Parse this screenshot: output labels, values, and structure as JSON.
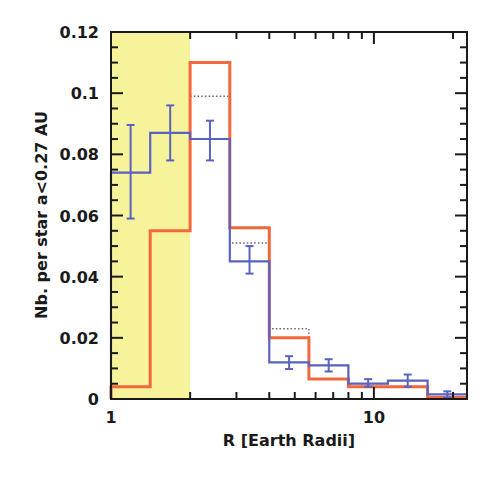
{
  "chart_data": {
    "type": "bar",
    "subtype": "step-histogram",
    "title": "",
    "xlabel": "R [Earth Radii]",
    "ylabel": "Nb. per star a<0.27 AU",
    "xscale": "log",
    "xlim": [
      1,
      22.6
    ],
    "ylim": [
      0,
      0.12
    ],
    "grid": false,
    "legend": null,
    "x_tick_labels": [
      {
        "value": 1,
        "label": "1"
      },
      {
        "value": 10,
        "label": "10"
      }
    ],
    "x_minor_ticks": [
      2,
      3,
      4,
      5,
      6,
      7,
      8,
      9,
      20
    ],
    "y_tick_labels": [
      {
        "value": 0,
        "label": "0"
      },
      {
        "value": 0.02,
        "label": "0.02"
      },
      {
        "value": 0.04,
        "label": "0.04"
      },
      {
        "value": 0.06,
        "label": "0.06"
      },
      {
        "value": 0.08,
        "label": "0.08"
      },
      {
        "value": 0.1,
        "label": "0.1"
      },
      {
        "value": 0.12,
        "label": "0.12"
      }
    ],
    "bin_edges": [
      1,
      1.41,
      2,
      2.83,
      4,
      5.66,
      8,
      11.3,
      16,
      22.6
    ],
    "shaded_region": {
      "x_from": 1,
      "x_to": 2,
      "color": "#f7f39a"
    },
    "series": [
      {
        "name": "orange-histogram",
        "color": "#f2683c",
        "style": "solid",
        "values": [
          0.004,
          0.055,
          0.11,
          0.056,
          0.02,
          0.0065,
          0.004,
          0.004,
          0.0005
        ]
      },
      {
        "name": "dotted-histogram",
        "color": "#7a5a7a",
        "style": "dotted",
        "values": [
          null,
          null,
          0.099,
          0.051,
          0.023,
          0.011,
          0.005,
          0.004,
          null
        ]
      },
      {
        "name": "blue-histogram",
        "color": "#5a62c0",
        "style": "solid",
        "values": [
          0.074,
          0.087,
          0.085,
          0.045,
          0.012,
          0.011,
          0.005,
          0.006,
          0.0015
        ],
        "err_low": [
          0.059,
          0.078,
          0.078,
          0.041,
          0.0098,
          0.009,
          0.004,
          0.004,
          0.0005
        ],
        "err_high": [
          0.0896,
          0.096,
          0.091,
          0.05,
          0.014,
          0.013,
          0.0065,
          0.008,
          0.0025
        ]
      }
    ]
  }
}
